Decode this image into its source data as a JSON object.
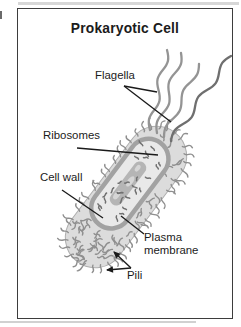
{
  "title": "Prokaryotic Cell",
  "labels": {
    "flagella": "Flagella",
    "ribosomes": "Ribosomes",
    "cell_wall": "Cell wall",
    "plasma_membrane": "Plasma membrane",
    "pili": "Pili"
  },
  "colors": {
    "frame": "#3d3d3d",
    "text": "#1b1b1b",
    "pointer_line": "#1a1a1a",
    "cell_body": "#dcdcdc",
    "cell_body_edge": "#aeaeae",
    "pili_stroke": "#8f8f8f",
    "membrane": "#a2a2a2",
    "cytoplasm": "#e9e9e9",
    "nucleoid": "#b5b5b5",
    "nucleoid_spot": "#d6d6d6",
    "ribosome_dash": "#707070",
    "flagella": "#949494",
    "flagella_dark": "#6f6f6f"
  }
}
